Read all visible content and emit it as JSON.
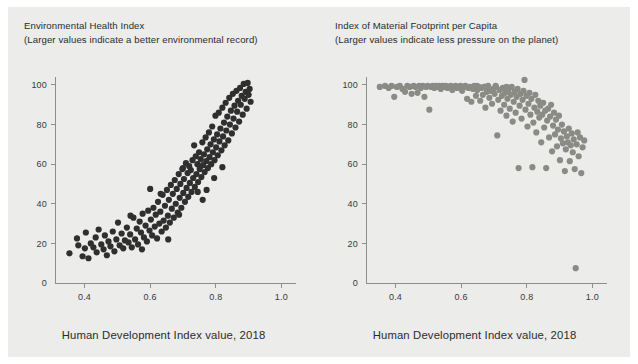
{
  "figure": {
    "background_color": "#ffffff",
    "panel_color": "#ececeb",
    "axis_color": "#8d8d8a",
    "text_color": "#2b2b2b"
  },
  "chart_data": [
    {
      "id": "environmental-health-index",
      "type": "scatter",
      "title": "Environmental Health Index",
      "subtitle": "(Larger values indicate a better environmental record)",
      "xlabel": "Human Development Index value, 2018",
      "ylabel": "",
      "xlim": [
        0.31,
        1.02
      ],
      "ylim": [
        0,
        104
      ],
      "xticks": [
        0.4,
        0.6,
        0.8,
        1.0
      ],
      "xticklabels": [
        "0.4",
        "0.6",
        "0.8",
        "1.0"
      ],
      "yticks": [
        0,
        20,
        40,
        60,
        80,
        100
      ],
      "yticklabels": [
        "0",
        "20",
        "40",
        "60",
        "80",
        "100"
      ],
      "grid": false,
      "legend": "none",
      "marker_color": "#2f2f2f",
      "marker_size": 3.1,
      "points": [
        [
          0.354,
          15.0
        ],
        [
          0.377,
          22.5
        ],
        [
          0.381,
          19.0
        ],
        [
          0.394,
          13.5
        ],
        [
          0.401,
          17.5
        ],
        [
          0.404,
          25.5
        ],
        [
          0.412,
          12.5
        ],
        [
          0.419,
          20.0
        ],
        [
          0.427,
          18.0
        ],
        [
          0.434,
          23.0
        ],
        [
          0.437,
          15.5
        ],
        [
          0.443,
          27.0
        ],
        [
          0.451,
          19.5
        ],
        [
          0.458,
          17.0
        ],
        [
          0.462,
          24.0
        ],
        [
          0.468,
          14.0
        ],
        [
          0.473,
          21.0
        ],
        [
          0.479,
          18.5
        ],
        [
          0.486,
          26.0
        ],
        [
          0.491,
          16.0
        ],
        [
          0.497,
          22.0
        ],
        [
          0.502,
          30.5
        ],
        [
          0.507,
          19.0
        ],
        [
          0.513,
          25.0
        ],
        [
          0.518,
          17.5
        ],
        [
          0.523,
          21.5
        ],
        [
          0.529,
          28.0
        ],
        [
          0.534,
          20.5
        ],
        [
          0.539,
          24.5
        ],
        [
          0.544,
          18.0
        ],
        [
          0.549,
          33.0
        ],
        [
          0.554,
          22.0
        ],
        [
          0.559,
          27.5
        ],
        [
          0.563,
          19.5
        ],
        [
          0.568,
          31.0
        ],
        [
          0.572,
          25.5
        ],
        [
          0.577,
          35.0
        ],
        [
          0.581,
          23.0
        ],
        [
          0.586,
          29.0
        ],
        [
          0.59,
          21.0
        ],
        [
          0.594,
          36.5
        ],
        [
          0.598,
          26.5
        ],
        [
          0.602,
          32.0
        ],
        [
          0.606,
          24.0
        ],
        [
          0.61,
          38.0
        ],
        [
          0.614,
          28.5
        ],
        [
          0.617,
          34.5
        ],
        [
          0.621,
          22.5
        ],
        [
          0.624,
          41.0
        ],
        [
          0.628,
          30.0
        ],
        [
          0.631,
          36.0
        ],
        [
          0.635,
          26.0
        ],
        [
          0.638,
          44.5
        ],
        [
          0.641,
          31.5
        ],
        [
          0.645,
          39.0
        ],
        [
          0.648,
          28.0
        ],
        [
          0.651,
          47.0
        ],
        [
          0.654,
          34.0
        ],
        [
          0.657,
          42.0
        ],
        [
          0.66,
          30.5
        ],
        [
          0.663,
          49.5
        ],
        [
          0.666,
          37.5
        ],
        [
          0.669,
          45.0
        ],
        [
          0.672,
          33.0
        ],
        [
          0.675,
          52.0
        ],
        [
          0.678,
          40.0
        ],
        [
          0.681,
          47.5
        ],
        [
          0.684,
          35.5
        ],
        [
          0.687,
          55.0
        ],
        [
          0.69,
          43.0
        ],
        [
          0.692,
          50.0
        ],
        [
          0.695,
          38.0
        ],
        [
          0.698,
          57.5
        ],
        [
          0.701,
          45.5
        ],
        [
          0.703,
          52.5
        ],
        [
          0.706,
          41.0
        ],
        [
          0.709,
          60.5
        ],
        [
          0.711,
          48.0
        ],
        [
          0.714,
          55.5
        ],
        [
          0.716,
          43.5
        ],
        [
          0.719,
          59.0
        ],
        [
          0.721,
          50.5
        ],
        [
          0.724,
          57.0
        ],
        [
          0.726,
          46.0
        ],
        [
          0.729,
          62.0
        ],
        [
          0.731,
          53.0
        ],
        [
          0.734,
          69.5
        ],
        [
          0.736,
          48.5
        ],
        [
          0.739,
          64.0
        ],
        [
          0.741,
          55.0
        ],
        [
          0.744,
          60.0
        ],
        [
          0.746,
          51.0
        ],
        [
          0.749,
          66.0
        ],
        [
          0.751,
          57.5
        ],
        [
          0.754,
          62.5
        ],
        [
          0.756,
          53.5
        ],
        [
          0.759,
          71.0
        ],
        [
          0.761,
          59.5
        ],
        [
          0.764,
          65.0
        ],
        [
          0.766,
          56.0
        ],
        [
          0.769,
          73.5
        ],
        [
          0.771,
          61.5
        ],
        [
          0.774,
          67.5
        ],
        [
          0.776,
          58.0
        ],
        [
          0.779,
          76.0
        ],
        [
          0.781,
          63.5
        ],
        [
          0.784,
          70.0
        ],
        [
          0.786,
          60.0
        ],
        [
          0.789,
          79.0
        ],
        [
          0.791,
          66.0
        ],
        [
          0.794,
          72.5
        ],
        [
          0.796,
          62.0
        ],
        [
          0.799,
          84.5
        ],
        [
          0.801,
          68.5
        ],
        [
          0.804,
          75.0
        ],
        [
          0.806,
          64.5
        ],
        [
          0.809,
          86.0
        ],
        [
          0.811,
          71.5
        ],
        [
          0.814,
          78.0
        ],
        [
          0.817,
          67.0
        ],
        [
          0.82,
          88.5
        ],
        [
          0.822,
          74.0
        ],
        [
          0.825,
          81.0
        ],
        [
          0.827,
          69.5
        ],
        [
          0.83,
          91.0
        ],
        [
          0.832,
          77.0
        ],
        [
          0.835,
          84.0
        ],
        [
          0.838,
          72.0
        ],
        [
          0.841,
          93.5
        ],
        [
          0.843,
          80.0
        ],
        [
          0.846,
          87.0
        ],
        [
          0.849,
          75.5
        ],
        [
          0.852,
          95.5
        ],
        [
          0.854,
          83.0
        ],
        [
          0.857,
          89.5
        ],
        [
          0.86,
          78.5
        ],
        [
          0.863,
          97.0
        ],
        [
          0.865,
          86.5
        ],
        [
          0.868,
          92.0
        ],
        [
          0.871,
          81.5
        ],
        [
          0.874,
          98.5
        ],
        [
          0.876,
          90.0
        ],
        [
          0.879,
          94.5
        ],
        [
          0.882,
          85.0
        ],
        [
          0.885,
          100.5
        ],
        [
          0.888,
          93.0
        ],
        [
          0.891,
          96.5
        ],
        [
          0.894,
          88.0
        ],
        [
          0.897,
          101.0
        ],
        [
          0.9,
          95.0
        ],
        [
          0.903,
          98.0
        ],
        [
          0.906,
          91.5
        ],
        [
          0.7,
          58.0
        ],
        [
          0.745,
          46.0
        ],
        [
          0.688,
          34.5
        ],
        [
          0.632,
          45.0
        ],
        [
          0.655,
          22.0
        ],
        [
          0.6,
          47.5
        ],
        [
          0.575,
          17.0
        ],
        [
          0.54,
          34.0
        ],
        [
          0.772,
          47.0
        ],
        [
          0.795,
          53.0
        ],
        [
          0.82,
          58.5
        ],
        [
          0.76,
          42.0
        ]
      ]
    },
    {
      "id": "material-footprint-index",
      "type": "scatter",
      "title": "Index of Material Footprint per Capita",
      "subtitle": "(Larger values indicate less pressure on the planet)",
      "xlabel": "Human Development Index value, 2018",
      "ylabel": "",
      "xlim": [
        0.31,
        1.02
      ],
      "ylim": [
        0,
        104
      ],
      "xticks": [
        0.4,
        0.6,
        0.8,
        1.0
      ],
      "xticklabels": [
        "0.4",
        "0.6",
        "0.8",
        "1.0"
      ],
      "yticks": [
        0,
        20,
        40,
        60,
        80,
        100
      ],
      "yticklabels": [
        "0",
        "20",
        "40",
        "60",
        "80",
        "100"
      ],
      "grid": false,
      "legend": "none",
      "marker_color": "#8b8b86",
      "marker_size": 3.1,
      "points": [
        [
          0.352,
          99.0
        ],
        [
          0.368,
          99.5
        ],
        [
          0.379,
          98.5
        ],
        [
          0.388,
          99.5
        ],
        [
          0.396,
          94.0
        ],
        [
          0.404,
          99.0
        ],
        [
          0.413,
          99.5
        ],
        [
          0.421,
          98.0
        ],
        [
          0.429,
          96.5
        ],
        [
          0.436,
          99.5
        ],
        [
          0.443,
          99.0
        ],
        [
          0.449,
          95.5
        ],
        [
          0.455,
          99.5
        ],
        [
          0.461,
          99.0
        ],
        [
          0.467,
          96.0
        ],
        [
          0.472,
          99.5
        ],
        [
          0.477,
          98.5
        ],
        [
          0.483,
          99.5
        ],
        [
          0.488,
          94.0
        ],
        [
          0.493,
          99.0
        ],
        [
          0.498,
          99.5
        ],
        [
          0.503,
          87.5
        ],
        [
          0.508,
          99.0
        ],
        [
          0.513,
          99.5
        ],
        [
          0.518,
          98.5
        ],
        [
          0.523,
          99.5
        ],
        [
          0.528,
          99.0
        ],
        [
          0.533,
          99.5
        ],
        [
          0.538,
          98.0
        ],
        [
          0.543,
          99.5
        ],
        [
          0.548,
          99.0
        ],
        [
          0.553,
          99.5
        ],
        [
          0.558,
          98.5
        ],
        [
          0.563,
          99.0
        ],
        [
          0.568,
          99.5
        ],
        [
          0.573,
          97.5
        ],
        [
          0.578,
          99.0
        ],
        [
          0.583,
          99.5
        ],
        [
          0.588,
          98.5
        ],
        [
          0.593,
          99.0
        ],
        [
          0.598,
          99.5
        ],
        [
          0.603,
          97.0
        ],
        [
          0.608,
          99.0
        ],
        [
          0.613,
          99.5
        ],
        [
          0.618,
          93.0
        ],
        [
          0.622,
          98.5
        ],
        [
          0.627,
          99.0
        ],
        [
          0.631,
          91.5
        ],
        [
          0.636,
          98.0
        ],
        [
          0.64,
          99.5
        ],
        [
          0.645,
          94.5
        ],
        [
          0.649,
          97.5
        ],
        [
          0.654,
          99.0
        ],
        [
          0.658,
          92.0
        ],
        [
          0.662,
          98.5
        ],
        [
          0.666,
          95.0
        ],
        [
          0.67,
          99.0
        ],
        [
          0.674,
          88.5
        ],
        [
          0.678,
          96.5
        ],
        [
          0.682,
          99.5
        ],
        [
          0.686,
          93.5
        ],
        [
          0.69,
          97.0
        ],
        [
          0.694,
          90.5
        ],
        [
          0.698,
          98.0
        ],
        [
          0.702,
          95.5
        ],
        [
          0.706,
          99.0
        ],
        [
          0.71,
          74.5
        ],
        [
          0.713,
          92.5
        ],
        [
          0.717,
          97.5
        ],
        [
          0.72,
          87.0
        ],
        [
          0.724,
          94.5
        ],
        [
          0.727,
          98.5
        ],
        [
          0.731,
          90.0
        ],
        [
          0.734,
          96.0
        ],
        [
          0.738,
          84.5
        ],
        [
          0.741,
          93.0
        ],
        [
          0.744,
          97.5
        ],
        [
          0.748,
          88.0
        ],
        [
          0.751,
          95.0
        ],
        [
          0.754,
          99.0
        ],
        [
          0.757,
          81.5
        ],
        [
          0.76,
          91.5
        ],
        [
          0.763,
          96.5
        ],
        [
          0.766,
          86.0
        ],
        [
          0.769,
          94.0
        ],
        [
          0.772,
          98.0
        ],
        [
          0.775,
          58.0
        ],
        [
          0.778,
          89.5
        ],
        [
          0.781,
          95.5
        ],
        [
          0.784,
          83.0
        ],
        [
          0.787,
          92.5
        ],
        [
          0.79,
          97.0
        ],
        [
          0.793,
          102.5
        ],
        [
          0.796,
          87.5
        ],
        [
          0.799,
          94.5
        ],
        [
          0.802,
          79.0
        ],
        [
          0.805,
          90.5
        ],
        [
          0.808,
          96.0
        ],
        [
          0.811,
          85.0
        ],
        [
          0.814,
          93.0
        ],
        [
          0.817,
          58.5
        ],
        [
          0.82,
          81.0
        ],
        [
          0.823,
          88.5
        ],
        [
          0.826,
          95.0
        ],
        [
          0.829,
          76.0
        ],
        [
          0.832,
          86.5
        ],
        [
          0.835,
          92.0
        ],
        [
          0.838,
          83.5
        ],
        [
          0.841,
          89.5
        ],
        [
          0.844,
          71.0
        ],
        [
          0.847,
          85.0
        ],
        [
          0.85,
          91.0
        ],
        [
          0.853,
          78.5
        ],
        [
          0.856,
          87.0
        ],
        [
          0.859,
          58.0
        ],
        [
          0.862,
          82.0
        ],
        [
          0.865,
          88.0
        ],
        [
          0.868,
          73.5
        ],
        [
          0.871,
          84.0
        ],
        [
          0.874,
          90.0
        ],
        [
          0.877,
          66.5
        ],
        [
          0.88,
          79.5
        ],
        [
          0.883,
          86.0
        ],
        [
          0.886,
          75.0
        ],
        [
          0.889,
          82.5
        ],
        [
          0.892,
          69.0
        ],
        [
          0.895,
          77.5
        ],
        [
          0.898,
          84.5
        ],
        [
          0.901,
          62.0
        ],
        [
          0.904,
          73.0
        ],
        [
          0.907,
          80.0
        ],
        [
          0.91,
          70.5
        ],
        [
          0.913,
          76.5
        ],
        [
          0.916,
          56.5
        ],
        [
          0.919,
          67.5
        ],
        [
          0.922,
          74.0
        ],
        [
          0.925,
          71.0
        ],
        [
          0.928,
          78.0
        ],
        [
          0.931,
          61.5
        ],
        [
          0.934,
          69.5
        ],
        [
          0.937,
          75.5
        ],
        [
          0.94,
          66.0
        ],
        [
          0.943,
          72.5
        ],
        [
          0.946,
          57.5
        ],
        [
          0.949,
          7.5
        ],
        [
          0.952,
          70.0
        ],
        [
          0.955,
          76.0
        ],
        [
          0.958,
          64.0
        ],
        [
          0.962,
          73.5
        ],
        [
          0.966,
          55.5
        ],
        [
          0.97,
          68.5
        ],
        [
          0.975,
          72.0
        ],
        [
          0.648,
          99.5
        ],
        [
          0.672,
          99.0
        ],
        [
          0.705,
          99.5
        ],
        [
          0.738,
          99.0
        ]
      ]
    }
  ]
}
